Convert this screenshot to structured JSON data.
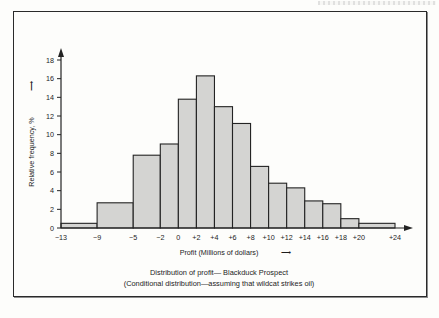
{
  "figure": {
    "caption_line_1": "Distribution of profit— Blackduck Prospect",
    "caption_line_2": "(Conditional distribution—assuming that wildcat strikes oil)"
  },
  "axes": {
    "x_title": "Profit (Millions of dollars)",
    "x_title_arrow": "⟶",
    "y_title": "Relative frequency, %",
    "y_title_arrow": "⟶",
    "x_tick_labels": [
      "−13",
      "−9",
      "−5",
      "−2",
      "0",
      "+2",
      "+4",
      "+6",
      "+8",
      "+10",
      "+12",
      "+14",
      "+16",
      "+18",
      "+20",
      "+24"
    ],
    "y_tick_labels": [
      "0",
      "2",
      "4",
      "6",
      "8",
      "10",
      "12",
      "14",
      "16",
      "18"
    ]
  },
  "colors": {
    "bar_fill": "#d4d4d2",
    "bar_stroke": "#232323",
    "frame": "#2a2a2a",
    "page_background": "#fdfdfb"
  },
  "chart_data": {
    "type": "bar",
    "title": "Distribution of profit— Blackduck Prospect",
    "subtitle": "(Conditional distribution—assuming that wildcat strikes oil)",
    "xlabel": "Profit (Millions of dollars)",
    "ylabel": "Relative frequency, %",
    "xlim": [
      -13,
      24
    ],
    "ylim": [
      0,
      18
    ],
    "grid": false,
    "legend": null,
    "note": "Histogram with unequal bin widths; x tick labels mark the bin edges.",
    "bin_edges": [
      -13,
      -9,
      -5,
      -2,
      0,
      2,
      4,
      6,
      8,
      10,
      12,
      14,
      16,
      18,
      20,
      24
    ],
    "categories": [
      "-13 to -9",
      "-9 to -5",
      "-5 to -2",
      "-2 to 0",
      "0 to +2",
      "+2 to +4",
      "+4 to +6",
      "+6 to +8",
      "+8 to +10",
      "+10 to +12",
      "+12 to +14",
      "+14 to +16",
      "+16 to +18",
      "+18 to +20",
      "+20 to +24"
    ],
    "values": [
      0.5,
      2.7,
      7.8,
      9.0,
      13.8,
      16.3,
      13.0,
      11.2,
      6.6,
      4.8,
      4.3,
      2.9,
      2.6,
      1.0,
      0.5
    ]
  }
}
